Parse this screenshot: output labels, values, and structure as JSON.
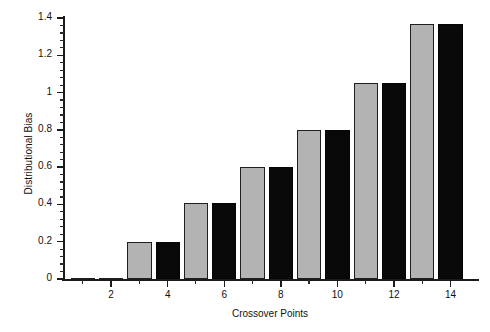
{
  "chart_data": {
    "type": "bar",
    "title": "",
    "xlabel": "Crossover Points",
    "ylabel": "Distributional Bias",
    "categories": [
      1,
      2,
      3,
      4,
      5,
      6,
      7,
      8,
      9,
      10,
      11,
      12,
      13,
      14
    ],
    "series": [
      {
        "name": "Distributional Bias",
        "values": [
          0,
          0,
          0.2,
          0.2,
          0.41,
          0.41,
          0.6,
          0.6,
          0.8,
          0.8,
          1.05,
          1.05,
          1.37,
          1.37
        ],
        "colors": [
          "gray",
          "black",
          "gray",
          "black",
          "gray",
          "black",
          "gray",
          "black",
          "gray",
          "black",
          "gray",
          "black",
          "gray",
          "black"
        ]
      }
    ],
    "ylim": [
      0,
      1.4
    ],
    "xlim": [
      0.3,
      14.9
    ],
    "ytick_labels": [
      "0",
      "0.2",
      "0.4",
      "0.6",
      "0.8",
      "1",
      "1.2",
      "1.4"
    ],
    "ytick_values": [
      0,
      0.2,
      0.4,
      0.6,
      0.8,
      1,
      1.2,
      1.4
    ],
    "ytick_minor_count": 4,
    "xtick_labels": [
      "2",
      "4",
      "6",
      "8",
      "10",
      "12",
      "14"
    ],
    "xtick_values": [
      2,
      4,
      6,
      8,
      10,
      12,
      14
    ],
    "grid": false,
    "legend": null,
    "colors": {
      "gray_bar": "#b3b3b3",
      "black_bar": "#090909",
      "bar_edge": "#1f1f1f",
      "axis": "#1b1b1b",
      "background": "#ffffff"
    }
  }
}
